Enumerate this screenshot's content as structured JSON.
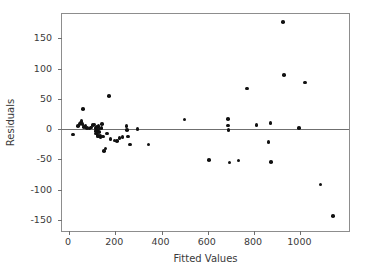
{
  "chart_data": {
    "type": "scatter",
    "title": "",
    "xlabel": "Fitted Values",
    "ylabel": "Residuals",
    "xlim": [
      -30,
      1210
    ],
    "ylim": [
      -168,
      190
    ],
    "xticks": [
      0,
      200,
      400,
      600,
      800,
      1000
    ],
    "xticklabels": [
      "0",
      "200",
      "400",
      "600",
      "800",
      "1000"
    ],
    "yticks": [
      150,
      100,
      50,
      0,
      -50,
      -100,
      -150
    ],
    "yticklabels": [
      "150",
      "100",
      "50",
      "0",
      "-50",
      "-100",
      "-150"
    ],
    "grid": false,
    "legend": null,
    "reference_lines": [
      {
        "orientation": "horizontal",
        "y": 0,
        "color": "#6f6f6f"
      }
    ],
    "marker": {
      "shape": "circle",
      "filled": true,
      "color": "#111111",
      "size": 3.6
    },
    "points": [
      {
        "x": 18,
        "y": -9
      },
      {
        "x": 38,
        "y": 5
      },
      {
        "x": 45,
        "y": 9
      },
      {
        "x": 52,
        "y": 11
      },
      {
        "x": 55,
        "y": 13
      },
      {
        "x": 58,
        "y": 9
      },
      {
        "x": 62,
        "y": 33
      },
      {
        "x": 66,
        "y": 4
      },
      {
        "x": 72,
        "y": 6
      },
      {
        "x": 78,
        "y": 2
      },
      {
        "x": 88,
        "y": 1
      },
      {
        "x": 96,
        "y": 3
      },
      {
        "x": 104,
        "y": 7
      },
      {
        "x": 110,
        "y": 8
      },
      {
        "x": 114,
        "y": 2
      },
      {
        "x": 116,
        "y": -3
      },
      {
        "x": 118,
        "y": -7
      },
      {
        "x": 120,
        "y": 4
      },
      {
        "x": 122,
        "y": -1
      },
      {
        "x": 124,
        "y": -10
      },
      {
        "x": 126,
        "y": -12
      },
      {
        "x": 128,
        "y": 5
      },
      {
        "x": 130,
        "y": -5
      },
      {
        "x": 132,
        "y": 1
      },
      {
        "x": 134,
        "y": -11
      },
      {
        "x": 136,
        "y": -14
      },
      {
        "x": 140,
        "y": 2
      },
      {
        "x": 144,
        "y": 9
      },
      {
        "x": 148,
        "y": -12
      },
      {
        "x": 152,
        "y": -36
      },
      {
        "x": 158,
        "y": -32
      },
      {
        "x": 165,
        "y": -7
      },
      {
        "x": 172,
        "y": 55
      },
      {
        "x": 180,
        "y": -16
      },
      {
        "x": 196,
        "y": -19
      },
      {
        "x": 208,
        "y": -20
      },
      {
        "x": 218,
        "y": -15
      },
      {
        "x": 232,
        "y": -13
      },
      {
        "x": 248,
        "y": 5
      },
      {
        "x": 252,
        "y": -1
      },
      {
        "x": 256,
        "y": -12
      },
      {
        "x": 264,
        "y": -25
      },
      {
        "x": 296,
        "y": 0
      },
      {
        "x": 344,
        "y": -25
      },
      {
        "x": 500,
        "y": 16
      },
      {
        "x": 604,
        "y": -51
      },
      {
        "x": 686,
        "y": 17
      },
      {
        "x": 688,
        "y": 6
      },
      {
        "x": 690,
        "y": -1
      },
      {
        "x": 694,
        "y": -55
      },
      {
        "x": 732,
        "y": -52
      },
      {
        "x": 770,
        "y": 67
      },
      {
        "x": 810,
        "y": 7
      },
      {
        "x": 862,
        "y": -21
      },
      {
        "x": 870,
        "y": 10
      },
      {
        "x": 874,
        "y": -54
      },
      {
        "x": 924,
        "y": 177
      },
      {
        "x": 928,
        "y": 89
      },
      {
        "x": 994,
        "y": 2
      },
      {
        "x": 1020,
        "y": 77
      },
      {
        "x": 1086,
        "y": -91
      },
      {
        "x": 1140,
        "y": -143
      }
    ]
  }
}
